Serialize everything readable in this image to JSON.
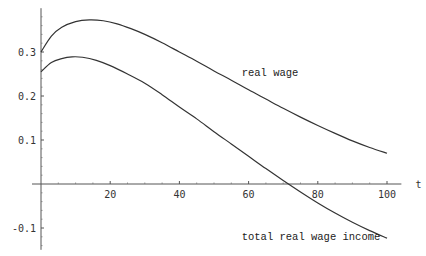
{
  "chart_data": {
    "type": "line",
    "title": "",
    "xlabel": "t",
    "ylabel": "",
    "xlim": [
      0,
      103
    ],
    "ylim": [
      -0.145,
      0.395
    ],
    "grid": false,
    "legend": "none (inline annotations)",
    "x_ticks": [
      20,
      40,
      60,
      80,
      100
    ],
    "x_tick_labels": [
      "20",
      "40",
      "60",
      "80",
      "100"
    ],
    "y_ticks": [
      -0.1,
      0.1,
      0.2,
      0.3
    ],
    "y_tick_labels": [
      "-0.1",
      "0.1",
      "0.2",
      "0.3"
    ],
    "series": [
      {
        "name": "real wage",
        "x": [
          0,
          3,
          6,
          10,
          14,
          18,
          22,
          26,
          30,
          35,
          40,
          45,
          50,
          55,
          60,
          65,
          70,
          75,
          80,
          85,
          90,
          95,
          100
        ],
        "values": [
          0.3,
          0.336,
          0.356,
          0.369,
          0.373,
          0.371,
          0.364,
          0.353,
          0.34,
          0.321,
          0.3,
          0.279,
          0.257,
          0.236,
          0.214,
          0.193,
          0.172,
          0.152,
          0.133,
          0.115,
          0.098,
          0.083,
          0.07
        ]
      },
      {
        "name": "total real wage income",
        "x": [
          0,
          3,
          6,
          9,
          12,
          16,
          20,
          25,
          30,
          35,
          40,
          45,
          50,
          55,
          60,
          65,
          70,
          75,
          80,
          85,
          90,
          95,
          100
        ],
        "values": [
          0.255,
          0.276,
          0.285,
          0.289,
          0.288,
          0.281,
          0.269,
          0.25,
          0.229,
          0.203,
          0.175,
          0.148,
          0.119,
          0.091,
          0.063,
          0.035,
          0.008,
          -0.018,
          -0.043,
          -0.066,
          -0.087,
          -0.106,
          -0.123
        ]
      }
    ],
    "annotations": [
      {
        "text": "real wage",
        "x": 58,
        "y": 0.245,
        "series": "real wage"
      },
      {
        "text": "total real wage income",
        "x": 58,
        "y": -0.127,
        "series": "total real wage income"
      }
    ]
  }
}
